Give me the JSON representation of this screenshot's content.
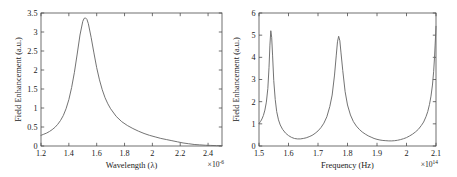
{
  "figure": {
    "background": "#ffffff",
    "axis_color": "#4d4d4d",
    "curve_color": "#6b6b6b"
  },
  "chart_data": [
    {
      "type": "line",
      "panel": "left",
      "title": "",
      "xlabel": "Wavelength (λ)",
      "ylabel": "Field Enhancement (a.u.)",
      "x_exponent_prefix": "×10",
      "x_exponent_value": "-6",
      "xlim": [
        1.2,
        2.5
      ],
      "ylim": [
        0,
        3.5
      ],
      "grid": false,
      "legend": null,
      "xticks": [
        "1.2",
        "1.4",
        "1.6",
        "1.8",
        "2",
        "2.2",
        "2.4"
      ],
      "xtick_values": [
        1.2,
        1.4,
        1.6,
        1.8,
        2.0,
        2.2,
        2.4
      ],
      "yticks": [
        "0",
        "0.5",
        "1",
        "1.5",
        "2",
        "2.5",
        "3",
        "3.5"
      ],
      "ytick_values": [
        0,
        0.5,
        1,
        1.5,
        2,
        2.5,
        3,
        3.5
      ],
      "series": [
        {
          "name": "field-enhancement-wavelength",
          "x": [
            1.2,
            1.22,
            1.24,
            1.26,
            1.28,
            1.3,
            1.32,
            1.34,
            1.36,
            1.38,
            1.4,
            1.42,
            1.44,
            1.46,
            1.48,
            1.5,
            1.51,
            1.52,
            1.53,
            1.54,
            1.56,
            1.58,
            1.6,
            1.62,
            1.64,
            1.66,
            1.68,
            1.7,
            1.74,
            1.78,
            1.82,
            1.86,
            1.9,
            1.94,
            1.98,
            2.02,
            2.06,
            2.1,
            2.14,
            2.18,
            2.22,
            2.26,
            2.3,
            2.34,
            2.38,
            2.42,
            2.46,
            2.5
          ],
          "y": [
            0.28,
            0.31,
            0.34,
            0.38,
            0.43,
            0.49,
            0.57,
            0.67,
            0.8,
            0.98,
            1.22,
            1.54,
            1.94,
            2.42,
            2.92,
            3.28,
            3.36,
            3.37,
            3.33,
            3.22,
            2.86,
            2.45,
            2.06,
            1.74,
            1.48,
            1.27,
            1.11,
            0.98,
            0.78,
            0.64,
            0.54,
            0.46,
            0.39,
            0.33,
            0.28,
            0.24,
            0.2,
            0.17,
            0.14,
            0.11,
            0.08,
            0.06,
            0.04,
            0.03,
            0.02,
            0.015,
            0.01,
            0.01
          ]
        }
      ]
    },
    {
      "type": "line",
      "panel": "right",
      "title": "",
      "xlabel": "Frequency (Hz)",
      "ylabel": "Field Enhancement (a.u.)",
      "x_exponent_prefix": "×10",
      "x_exponent_value": "14",
      "xlim": [
        1.5,
        2.1
      ],
      "ylim": [
        0,
        6
      ],
      "grid": false,
      "legend": null,
      "xticks": [
        "1.5",
        "1.6",
        "1.7",
        "1.8",
        "1.9",
        "2",
        "2.1"
      ],
      "xtick_values": [
        1.5,
        1.6,
        1.7,
        1.8,
        1.9,
        2.0,
        2.1
      ],
      "yticks": [
        "0",
        "1",
        "2",
        "3",
        "4",
        "5",
        "6"
      ],
      "ytick_values": [
        0,
        1,
        2,
        3,
        4,
        5,
        6
      ],
      "peaks": [
        {
          "x": 1.54,
          "y": 5.2
        },
        {
          "x": 1.77,
          "y": 4.95
        },
        {
          "x": 2.1,
          "y": 5.4
        }
      ],
      "troughs": [
        {
          "x": 1.62,
          "y": 0.32
        },
        {
          "x": 1.89,
          "y": 0.22
        }
      ],
      "series": [
        {
          "name": "field-enhancement-frequency",
          "x": [
            1.5,
            1.505,
            1.51,
            1.515,
            1.52,
            1.525,
            1.53,
            1.534,
            1.537,
            1.54,
            1.543,
            1.546,
            1.55,
            1.555,
            1.56,
            1.566,
            1.572,
            1.58,
            1.59,
            1.6,
            1.61,
            1.62,
            1.63,
            1.64,
            1.65,
            1.66,
            1.67,
            1.68,
            1.69,
            1.7,
            1.71,
            1.72,
            1.73,
            1.74,
            1.748,
            1.756,
            1.762,
            1.766,
            1.77,
            1.774,
            1.778,
            1.784,
            1.792,
            1.8,
            1.81,
            1.82,
            1.83,
            1.84,
            1.85,
            1.86,
            1.87,
            1.88,
            1.89,
            1.9,
            1.91,
            1.92,
            1.93,
            1.94,
            1.95,
            1.96,
            1.97,
            1.98,
            1.99,
            2.0,
            2.01,
            2.02,
            2.03,
            2.04,
            2.05,
            2.058,
            2.066,
            2.072,
            2.078,
            2.083,
            2.088,
            2.092,
            2.095,
            2.097,
            2.099,
            2.1
          ],
          "y": [
            1.02,
            1.1,
            1.22,
            1.38,
            1.62,
            1.98,
            2.6,
            3.55,
            4.55,
            5.2,
            4.9,
            4.1,
            2.95,
            2.1,
            1.55,
            1.18,
            0.95,
            0.75,
            0.58,
            0.47,
            0.39,
            0.34,
            0.32,
            0.32,
            0.34,
            0.37,
            0.42,
            0.48,
            0.57,
            0.68,
            0.83,
            1.03,
            1.32,
            1.78,
            2.3,
            3.2,
            4.1,
            4.7,
            4.95,
            4.75,
            4.2,
            3.4,
            2.45,
            1.85,
            1.4,
            1.1,
            0.9,
            0.75,
            0.63,
            0.54,
            0.46,
            0.4,
            0.34,
            0.3,
            0.27,
            0.25,
            0.24,
            0.23,
            0.23,
            0.24,
            0.26,
            0.29,
            0.33,
            0.38,
            0.45,
            0.53,
            0.63,
            0.75,
            0.92,
            1.08,
            1.32,
            1.55,
            1.88,
            2.25,
            2.75,
            3.35,
            4.0,
            4.55,
            5.1,
            5.4
          ]
        }
      ]
    }
  ]
}
